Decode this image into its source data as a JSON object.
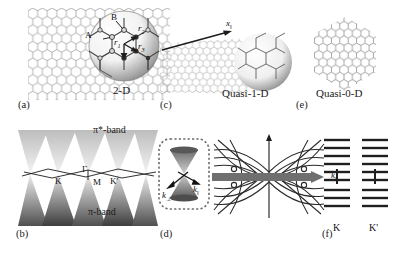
{
  "figure": {
    "panels": [
      {
        "id": "a",
        "tag": "(a)",
        "caption": "2-D"
      },
      {
        "id": "b",
        "tag": "(b)",
        "caption": ""
      },
      {
        "id": "c",
        "tag": "(c)",
        "caption": "Quasi-1-D"
      },
      {
        "id": "d",
        "tag": "(d)",
        "caption": ""
      },
      {
        "id": "e",
        "tag": "(e)",
        "caption": "Quasi-0-D"
      },
      {
        "id": "f",
        "tag": "(f)",
        "caption": ""
      }
    ]
  },
  "panel_a": {
    "tag": "(a)",
    "dimension_label": "2-D",
    "sublattice_a": "A",
    "sublattice_b": "B",
    "vector_1": "r1",
    "vector_2": "r2",
    "vector_3": "r3",
    "description": "Two-dimensional honeycomb graphene lattice with magnified inset showing A and B sublattice sites and the three nearest-neighbour vectors"
  },
  "panel_b": {
    "tag": "(b)",
    "upper_band": "π*-band",
    "lower_band": "π-band",
    "bz_points": [
      "K",
      "Γ",
      "M",
      "K'"
    ],
    "description": "Electronic band structure of graphene showing Dirac cones where the pi and pi* bands touch at the K and K' points"
  },
  "panel_c": {
    "tag": "(c)",
    "caption": "Quasi-1-D",
    "axis_label": "x‖",
    "description": "Rolled graphene sheet forming a quasi-one-dimensional carbon nanotube with axial coordinate"
  },
  "panel_d": {
    "tag": "(d)",
    "axis_perp": "k⊥",
    "axis_par": "k‖",
    "description": "Single Dirac cone with quantised perpendicular wavevector and continuous parallel wavevector"
  },
  "panel_d2": {
    "axis_label": "k‖",
    "description": "One-dimensional subbands obtained by cutting the Dirac cones along allowed quantisation lines"
  },
  "panel_e": {
    "tag": "(e)",
    "caption": "Quasi-0-D",
    "description": "Hexagonal graphene quantum dot / nanoflake, a quasi-zero-dimensional structure"
  },
  "panel_f": {
    "tag": "(f)",
    "valley_k": "K",
    "valley_kprime": "K'",
    "levels_above": 5,
    "levels_below": 5,
    "description": "Discrete energy levels at the K and K' valleys of a quasi-0-D graphene dot"
  },
  "colors": {
    "ink": "#1a1a1a",
    "lattice": "#8d8d8d",
    "shadow": "#6d6d6d",
    "band_fill": "#7a7a7a",
    "bar": "#707070",
    "background": "#ffffff"
  }
}
